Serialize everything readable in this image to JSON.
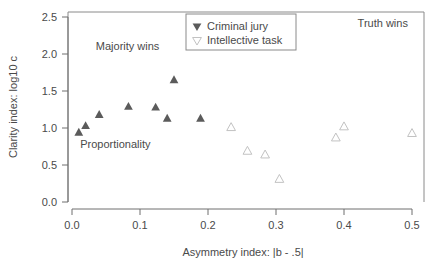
{
  "chart_data": {
    "type": "scatter",
    "title": "",
    "xlabel": "Asymmetry index:  |b - .5|",
    "ylabel": "Clarity index:  log10 c",
    "xlim": [
      -0.02,
      0.54
    ],
    "ylim": [
      -0.05,
      2.62
    ],
    "xticks": [
      0.0,
      0.1,
      0.2,
      0.3,
      0.4,
      0.5
    ],
    "xtick_labels": [
      "0.0",
      "0.1",
      "0.2",
      "0.3",
      "0.4",
      "0.5"
    ],
    "yticks": [
      0.0,
      0.5,
      1.0,
      1.5,
      2.0,
      2.5
    ],
    "ytick_labels": [
      "0.0",
      "0.5",
      "1.0",
      "1.5",
      "2.0",
      "2.5"
    ],
    "grid": false,
    "legend_position": "top-center",
    "series": [
      {
        "name": "Criminal jury",
        "marker": "filled-triangle",
        "color": "#5b5b5b",
        "points": [
          {
            "x": 0.01,
            "y": 0.94
          },
          {
            "x": 0.02,
            "y": 1.03
          },
          {
            "x": 0.04,
            "y": 1.18
          },
          {
            "x": 0.083,
            "y": 1.29
          },
          {
            "x": 0.123,
            "y": 1.28
          },
          {
            "x": 0.14,
            "y": 1.13
          },
          {
            "x": 0.15,
            "y": 1.65
          },
          {
            "x": 0.189,
            "y": 1.13
          }
        ]
      },
      {
        "name": "Intellective task",
        "marker": "open-triangle",
        "color": "#c2c2c2",
        "points": [
          {
            "x": 0.234,
            "y": 1.01
          },
          {
            "x": 0.258,
            "y": 0.69
          },
          {
            "x": 0.284,
            "y": 0.64
          },
          {
            "x": 0.305,
            "y": 0.31
          },
          {
            "x": 0.388,
            "y": 0.87
          },
          {
            "x": 0.4,
            "y": 1.02
          },
          {
            "x": 0.5,
            "y": 0.93
          }
        ]
      }
    ],
    "annotations": [
      {
        "text": "Majority wins",
        "x": 0.035,
        "y": 2.06
      },
      {
        "text": "Truth wins",
        "x": 0.42,
        "y": 2.36
      },
      {
        "text": "Proportionality",
        "x": 0.012,
        "y": 0.73
      }
    ]
  },
  "legend": {
    "entries": [
      {
        "label": "Criminal jury",
        "marker": "filled-triangle"
      },
      {
        "label": "Intellective task",
        "marker": "open-triangle"
      }
    ]
  },
  "colors": {
    "filled_marker": "#5b5b5b",
    "open_marker": "#c2c2c2",
    "axis": "#6e6e6e",
    "panel_border": "#8a8a8a",
    "text": "#4a4a4a",
    "background": "#ffffff"
  }
}
